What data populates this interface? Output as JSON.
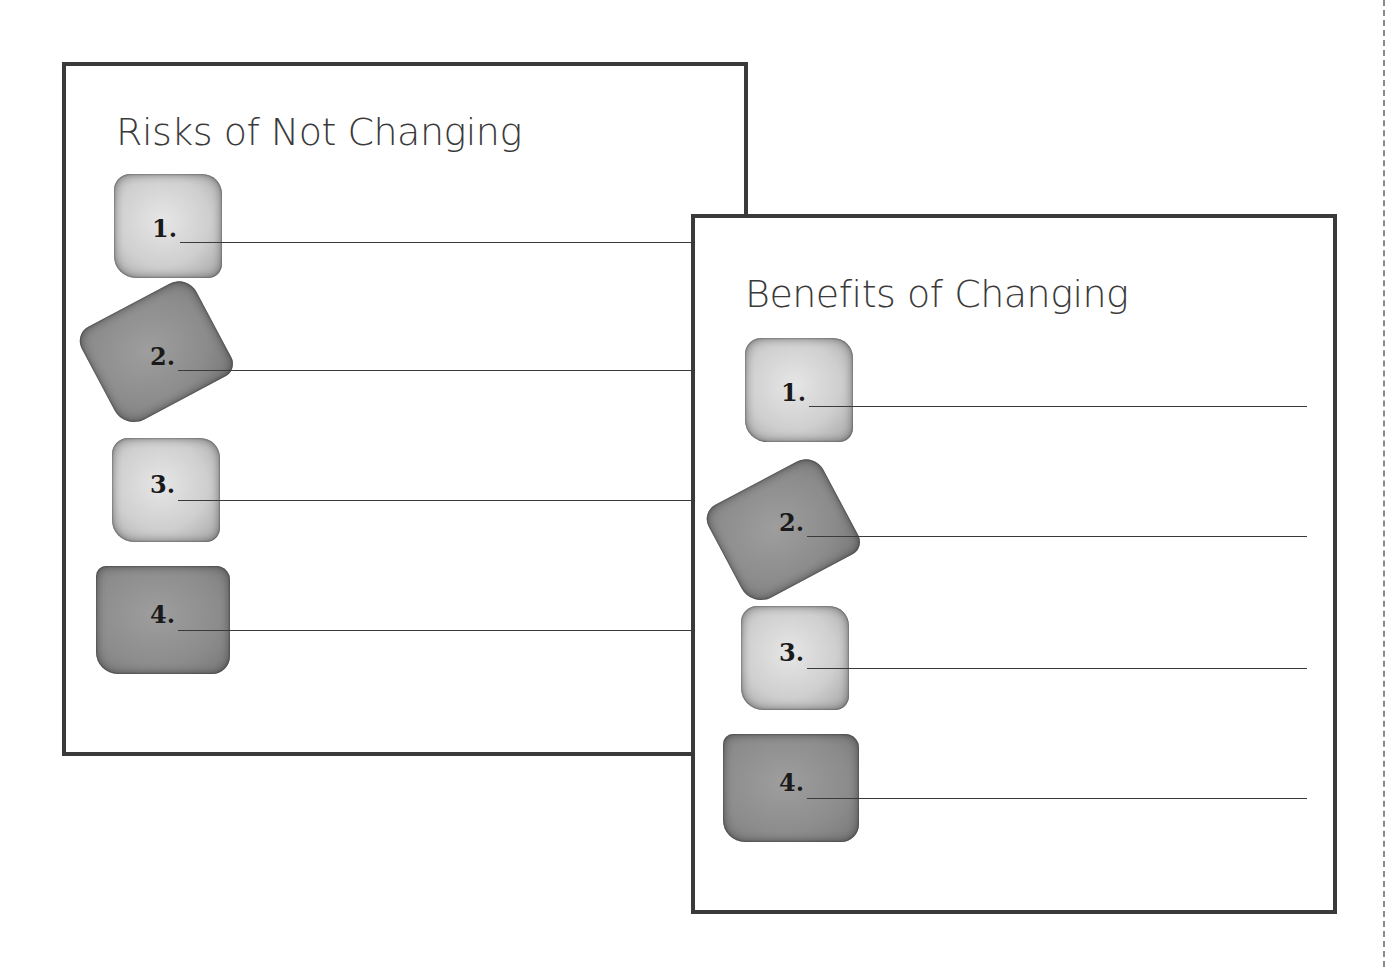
{
  "worksheet": {
    "risks_card": {
      "title": "Risks of Not Changing",
      "items": [
        {
          "number": "1.",
          "stone": "light",
          "answer": ""
        },
        {
          "number": "2.",
          "stone": "dark",
          "answer": ""
        },
        {
          "number": "3.",
          "stone": "light",
          "answer": ""
        },
        {
          "number": "4.",
          "stone": "dark",
          "answer": ""
        }
      ]
    },
    "benefits_card": {
      "title": "Benefits of Changing",
      "items": [
        {
          "number": "1.",
          "stone": "light",
          "answer": ""
        },
        {
          "number": "2.",
          "stone": "dark",
          "answer": ""
        },
        {
          "number": "3.",
          "stone": "light",
          "answer": ""
        },
        {
          "number": "4.",
          "stone": "dark",
          "answer": ""
        }
      ]
    },
    "colors": {
      "border": "#3a3a3a",
      "title_text": "#3a3a3a",
      "light_stone": "#cfcfcf",
      "dark_stone": "#8c8c8c",
      "cut_line": "#8a8a8a"
    }
  }
}
